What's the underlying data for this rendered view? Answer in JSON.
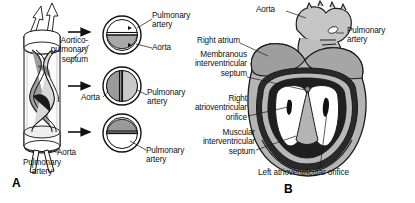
{
  "figure": {
    "type": "anatomical-illustration",
    "background_color": "#ffffff",
    "ink_color": "#111111"
  },
  "panels": [
    {
      "id": "A",
      "label": "A",
      "caption": "Spiral aorticopulmonary septum dividing the truncus arteriosus, with three transverse cross-sections",
      "label_x": 14,
      "label_y": 178
    },
    {
      "id": "B",
      "label": "B",
      "caption": "Coronal section of the developing heart showing the ventricles and septa",
      "label_x": 285,
      "label_y": 184
    }
  ],
  "panel_a": {
    "cylinder": {
      "name": "truncus-arteriosus",
      "top_arrows": 2,
      "bottom_vessels": 2,
      "septum_turns": 2
    },
    "labels": [
      {
        "id": "aorticopulmonary-septum",
        "text": "Aortico-\npulmonary\nseptum",
        "x": 88,
        "y": 40,
        "align": "right"
      },
      {
        "id": "aorta-bottom",
        "text": "Aorta",
        "x": 57,
        "y": 150,
        "align": "left"
      },
      {
        "id": "pulmonary-artery-bottom",
        "text": "Pulmonary\nartery",
        "x": 42,
        "y": 160,
        "align": "center"
      }
    ],
    "arrows": [
      {
        "id": "arrow-to-section-1",
        "x1": 68,
        "y1": 32,
        "x2": 92,
        "y2": 32
      },
      {
        "id": "arrow-to-section-2",
        "x1": 68,
        "y1": 86,
        "x2": 92,
        "y2": 86
      },
      {
        "id": "arrow-to-section-3",
        "x1": 68,
        "y1": 132,
        "x2": 92,
        "y2": 132
      }
    ],
    "cross_sections": [
      {
        "id": "cross-section-superior",
        "cx": 122,
        "cy": 35,
        "r": 19,
        "divider": "horizontal",
        "top_half_tone": "#ffffff",
        "bottom_half_tone": "#a8a8a8",
        "labels": [
          {
            "id": "pulmonary-artery",
            "text": "Pulmonary\nartery",
            "x": 152,
            "y": 14,
            "align": "left"
          },
          {
            "id": "aorta",
            "text": "Aorta",
            "x": 152,
            "y": 45,
            "align": "left"
          }
        ]
      },
      {
        "id": "cross-section-middle",
        "cx": 122,
        "cy": 86,
        "r": 19,
        "divider": "vertical",
        "left_half_tone": "#9a9a9a",
        "right_half_tone": "#c9c9c9",
        "labels": [
          {
            "id": "aorta",
            "text": "Aorta",
            "x": 96,
            "y": 96,
            "align": "right"
          },
          {
            "id": "pulmonary-artery",
            "text": "Pulmonary\nartery",
            "x": 148,
            "y": 92,
            "align": "left"
          }
        ]
      },
      {
        "id": "cross-section-inferior",
        "cx": 122,
        "cy": 133,
        "r": 19,
        "divider": "horizontal",
        "top_half_tone": "#9a9a9a",
        "bottom_half_tone": "#ffffff",
        "labels": [
          {
            "id": "pulmonary-artery",
            "text": "Pulmonary\nartery",
            "x": 146,
            "y": 148,
            "align": "left"
          }
        ]
      }
    ]
  },
  "panel_b": {
    "heart": {
      "name": "developing-heart-coronal-section",
      "structures": [
        "aortic-arch",
        "pulmonary-trunk",
        "right-atrium",
        "right-ventricle",
        "left-ventricle",
        "membranous-interventricular-septum",
        "muscular-interventricular-septum",
        "right-atrioventricular-orifice",
        "left-atrioventricular-orifice"
      ],
      "wall_tone": "#b0b0b0",
      "cavity_tone": "#ffffff",
      "outline_tone": "#1a1a1a"
    },
    "labels": [
      {
        "id": "aorta",
        "text": "Aorta",
        "x": 262,
        "y": 7,
        "align": "left"
      },
      {
        "id": "pulmonary-artery",
        "text": "Pulmonary\nartery",
        "x": 346,
        "y": 28,
        "align": "left"
      },
      {
        "id": "right-atrium",
        "text": "Right atrium",
        "x": 189,
        "y": 40,
        "align": "left"
      },
      {
        "id": "membranous-interventricular-septum",
        "text": "Membranous\ninterventricular\nseptum",
        "x": 246,
        "y": 60,
        "align": "right"
      },
      {
        "id": "right-atrioventricular-orifice",
        "text": "Right\natrioventricular\norifice",
        "x": 246,
        "y": 109,
        "align": "right"
      },
      {
        "id": "muscular-interventricular-septum",
        "text": "Muscular\ninterventricular\nseptum",
        "x": 254,
        "y": 143,
        "align": "right"
      },
      {
        "id": "left-atrioventricular-orifice",
        "text": "Left atrioventricular orifice",
        "x": 258,
        "y": 172,
        "align": "left"
      }
    ]
  }
}
